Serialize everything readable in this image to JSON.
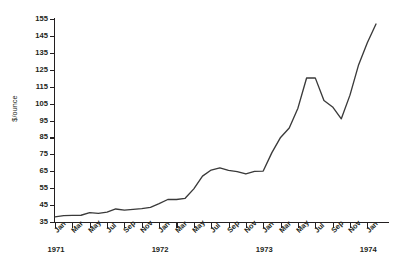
{
  "chart_data": {
    "type": "line",
    "title": "",
    "xlabel": "",
    "ylabel": "$/ounce",
    "ylim": [
      35,
      155
    ],
    "ytick_step": 10,
    "yticks": [
      155,
      145,
      135,
      125,
      115,
      105,
      95,
      85,
      75,
      65,
      55,
      45,
      35
    ],
    "grid": false,
    "legend": false,
    "line_color": "#3a3a3a",
    "x_tick_labels": [
      "Jan",
      "Mar",
      "May",
      "Jul",
      "Sep",
      "Nov",
      "Jan",
      "Mar",
      "May",
      "Jul",
      "Sep",
      "Nov",
      "Jan",
      "Mar",
      "May",
      "Jul",
      "Sep",
      "Nov",
      "Jan"
    ],
    "year_labels": [
      {
        "label": "1971",
        "at_index": 0
      },
      {
        "label": "1972",
        "at_index": 6
      },
      {
        "label": "1973",
        "at_index": 12
      },
      {
        "label": "1974",
        "at_index": 18
      }
    ],
    "x": [
      "Jan 1971",
      "Feb 1971",
      "Mar 1971",
      "Apr 1971",
      "May 1971",
      "Jun 1971",
      "Jul 1971",
      "Aug 1971",
      "Sep 1971",
      "Oct 1971",
      "Nov 1971",
      "Dec 1971",
      "Jan 1972",
      "Feb 1972",
      "Mar 1972",
      "Apr 1972",
      "May 1972",
      "Jun 1972",
      "Jul 1972",
      "Aug 1972",
      "Sep 1972",
      "Oct 1972",
      "Nov 1972",
      "Dec 1972",
      "Jan 1973",
      "Feb 1973",
      "Mar 1973",
      "Apr 1973",
      "May 1973",
      "Jun 1973",
      "Jul 1973",
      "Aug 1973",
      "Sep 1973",
      "Oct 1973",
      "Nov 1973",
      "Dec 1973",
      "Jan 1974",
      "Feb 1974"
    ],
    "values": [
      38.0,
      38.8,
      38.9,
      39.0,
      40.5,
      40.1,
      40.8,
      42.7,
      42.0,
      42.5,
      42.9,
      43.6,
      45.8,
      48.3,
      48.3,
      49.0,
      54.6,
      62.1,
      65.7,
      67.0,
      65.5,
      64.8,
      63.4,
      64.9,
      65.1,
      76.0,
      85.0,
      90.6,
      102.3,
      120.1,
      120.2,
      106.8,
      103.0,
      96.0,
      110.0,
      128.0,
      141.0,
      152.0
    ]
  }
}
